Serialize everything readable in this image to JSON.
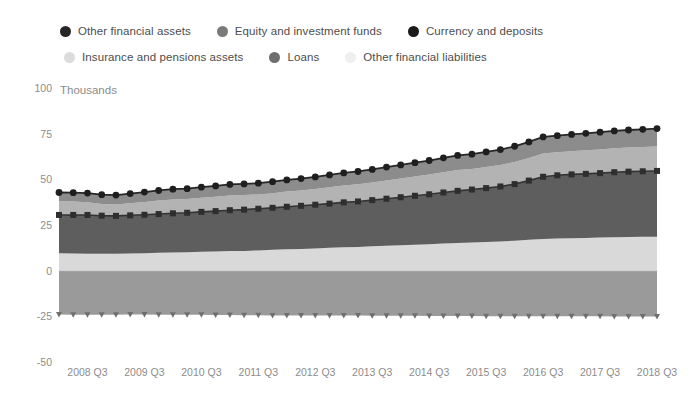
{
  "legend": {
    "rows": [
      [
        {
          "label": "Other financial assets",
          "color": "#262626",
          "marker": "circle-marker"
        },
        {
          "label": "Equity and investment funds",
          "color": "#7a7a7a",
          "marker": "circle-marker"
        },
        {
          "label": "Currency and deposits",
          "color": "#1a1a1a",
          "marker": "circle-marker"
        }
      ],
      [
        {
          "label": "Insurance and pensions assets",
          "color": "#dcdcdc",
          "marker": "circle-marker"
        },
        {
          "label": "Loans",
          "color": "#6e6e6e",
          "marker": "circle-marker"
        },
        {
          "label": "Other financial liabilities",
          "color": "#efefef",
          "marker": "circle-marker"
        }
      ]
    ]
  },
  "axes": {
    "y_unit": "Thousands",
    "y_ticks": [
      "100",
      "75",
      "50",
      "25",
      "0",
      "-25",
      "-50"
    ],
    "y_min": -50,
    "y_max": 100,
    "x_ticks": [
      "2008 Q3",
      "2009 Q3",
      "2010 Q3",
      "2011 Q3",
      "2012 Q3",
      "2013 Q3",
      "2014 Q3",
      "2015 Q3",
      "2016 Q3",
      "2017 Q3",
      "2018 Q3"
    ],
    "zero_line": true,
    "grid": false
  },
  "colors": {
    "insurance_pensions": "#d9d9d9",
    "loans": "#5e5e5e",
    "equity_funds": "#b3b3b3",
    "currency_deposits": "#8c8c8c",
    "other_financial_assets_line": "#262626",
    "other_financial_liabilities": "#9a9a9a",
    "axis_text": "#8c8c8c",
    "legend_text": "#4d4d4d",
    "background": "#ffffff"
  },
  "chart_data": {
    "type": "area",
    "title": "",
    "subtitle": "",
    "xlabel": "",
    "ylabel": "Thousands",
    "ylim": [
      -50,
      100
    ],
    "stacked": true,
    "grid": false,
    "legend_position": "top",
    "x": [
      "2008 Q1",
      "2008 Q2",
      "2008 Q3",
      "2008 Q4",
      "2009 Q1",
      "2009 Q2",
      "2009 Q3",
      "2009 Q4",
      "2010 Q1",
      "2010 Q2",
      "2010 Q3",
      "2010 Q4",
      "2011 Q1",
      "2011 Q2",
      "2011 Q3",
      "2011 Q4",
      "2012 Q1",
      "2012 Q2",
      "2012 Q3",
      "2012 Q4",
      "2013 Q1",
      "2013 Q2",
      "2013 Q3",
      "2013 Q4",
      "2014 Q1",
      "2014 Q2",
      "2014 Q3",
      "2014 Q4",
      "2015 Q1",
      "2015 Q2",
      "2015 Q3",
      "2015 Q4",
      "2016 Q1",
      "2016 Q2",
      "2016 Q3",
      "2016 Q4",
      "2017 Q1",
      "2017 Q2",
      "2017 Q3",
      "2017 Q4",
      "2018 Q1",
      "2018 Q2",
      "2018 Q3"
    ],
    "series": [
      {
        "name": "Insurance and pensions assets",
        "color": "#d9d9d9",
        "stack_order": 1,
        "values": [
          9.5,
          9.4,
          9.3,
          9.2,
          9.2,
          9.4,
          9.6,
          9.8,
          10.0,
          10.1,
          10.3,
          10.5,
          10.7,
          10.8,
          11.1,
          11.4,
          11.7,
          11.9,
          12.2,
          12.5,
          12.8,
          13.0,
          13.3,
          13.6,
          13.9,
          14.2,
          14.5,
          14.9,
          15.2,
          15.4,
          15.7,
          16.0,
          16.4,
          16.9,
          17.4,
          17.6,
          17.8,
          17.9,
          18.1,
          18.3,
          18.4,
          18.5,
          18.6
        ]
      },
      {
        "name": "Loans",
        "color": "#5e5e5e",
        "stack_order": 2,
        "values": [
          21.0,
          21.1,
          21.2,
          20.9,
          20.8,
          20.9,
          21.0,
          21.2,
          21.4,
          21.6,
          21.9,
          22.1,
          22.4,
          22.6,
          22.8,
          23.0,
          23.3,
          23.6,
          23.9,
          24.2,
          24.6,
          24.9,
          25.3,
          25.8,
          26.3,
          26.8,
          27.3,
          27.9,
          28.5,
          29.0,
          29.5,
          30.1,
          31.0,
          32.4,
          34.0,
          34.6,
          34.9,
          35.1,
          35.3,
          35.6,
          35.8,
          35.9,
          36.0
        ]
      },
      {
        "name": "Equity and investment funds",
        "color": "#b3b3b3",
        "stack_order": 3,
        "values": [
          7.5,
          7.3,
          7.0,
          6.4,
          6.2,
          6.6,
          7.0,
          7.4,
          7.6,
          7.5,
          7.7,
          7.9,
          8.1,
          8.0,
          7.8,
          8.0,
          8.3,
          8.4,
          8.6,
          8.9,
          9.2,
          9.4,
          9.7,
          10.0,
          10.3,
          10.5,
          10.8,
          11.1,
          11.4,
          11.3,
          11.5,
          11.8,
          12.1,
          12.4,
          12.8,
          12.6,
          12.7,
          12.9,
          13.0,
          13.1,
          13.2,
          13.3,
          13.4
        ]
      },
      {
        "name": "Currency and deposits",
        "color": "#8c8c8c",
        "stack_order": 4,
        "values": [
          4.8,
          4.9,
          5.0,
          5.1,
          5.2,
          5.3,
          5.4,
          5.5,
          5.6,
          5.7,
          5.8,
          5.9,
          6.0,
          6.1,
          6.2,
          6.3,
          6.4,
          6.5,
          6.6,
          6.8,
          6.9,
          7.0,
          7.1,
          7.3,
          7.4,
          7.6,
          7.7,
          7.9,
          8.0,
          8.1,
          8.3,
          8.4,
          8.6,
          8.8,
          9.0,
          9.1,
          9.2,
          9.3,
          9.4,
          9.5,
          9.6,
          9.7,
          9.8
        ]
      },
      {
        "name": "Other financial liabilities",
        "color": "#9a9a9a",
        "stack_order": -1,
        "negative": true,
        "values": [
          -24.0,
          -24.1,
          -24.2,
          -24.2,
          -24.1,
          -24.0,
          -24.0,
          -24.1,
          -24.1,
          -24.2,
          -24.2,
          -24.3,
          -24.3,
          -24.4,
          -24.4,
          -24.5,
          -24.5,
          -24.5,
          -24.6,
          -24.6,
          -24.6,
          -24.6,
          -24.7,
          -24.7,
          -24.7,
          -24.7,
          -24.8,
          -24.8,
          -24.8,
          -24.8,
          -24.9,
          -24.9,
          -24.9,
          -24.9,
          -25.0,
          -25.0,
          -25.0,
          -25.0,
          -25.0,
          -25.1,
          -25.1,
          -25.1,
          -25.1
        ]
      }
    ],
    "markers": {
      "loans_top_line": "square-marker",
      "other_financial_assets_top_line": "circle-marker"
    }
  }
}
